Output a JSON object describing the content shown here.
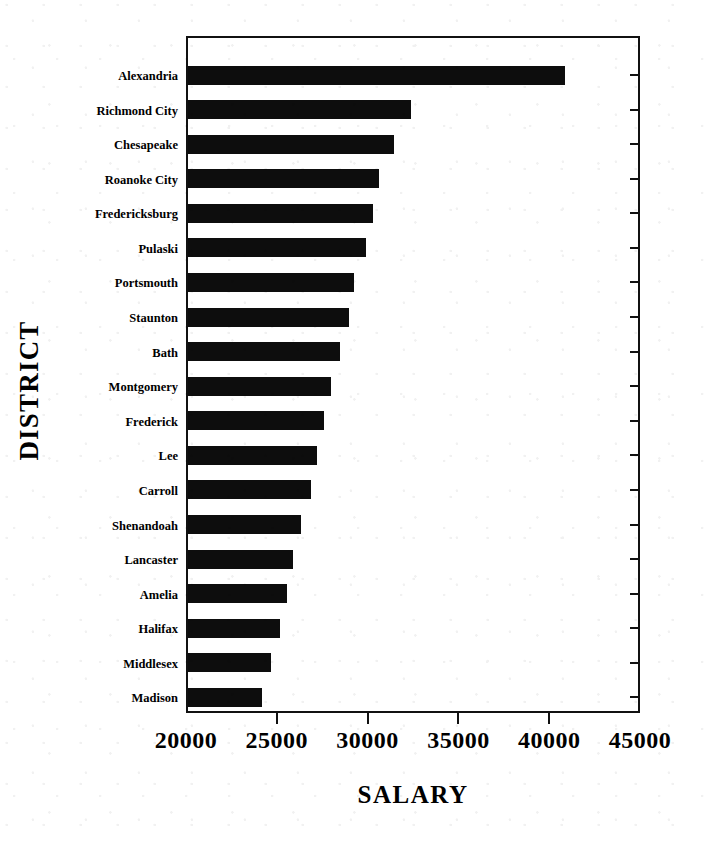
{
  "chart_data": {
    "type": "bar",
    "orientation": "horizontal",
    "title": "",
    "xlabel": "SALARY",
    "ylabel": "DISTRICT",
    "xlim": [
      20000,
      45000
    ],
    "xticks": [
      20000,
      25000,
      30000,
      35000,
      40000,
      45000
    ],
    "xtick_labels": [
      "20000",
      "25000",
      "30000",
      "35000",
      "40000",
      "45000"
    ],
    "grid": false,
    "legend": null,
    "bar_color": "#0d0d0d",
    "categories": [
      "Alexandria",
      "Richmond City",
      "Chesapeake",
      "Roanoke City",
      "Fredericksburg",
      "Pulaski",
      "Portsmouth",
      "Staunton",
      "Bath",
      "Montgomery",
      "Frederick",
      "Lee",
      "Carroll",
      "Shenandoah",
      "Lancaster",
      "Amelia",
      "Halifax",
      "Middlesex",
      "Madison"
    ],
    "values": [
      40750,
      32300,
      31350,
      30500,
      30200,
      29800,
      29150,
      28850,
      28350,
      27900,
      27500,
      27100,
      26800,
      26200,
      25800,
      25450,
      25050,
      24550,
      24100
    ]
  }
}
